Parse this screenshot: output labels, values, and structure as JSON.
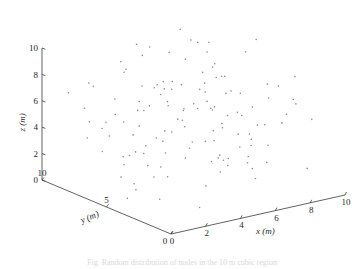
{
  "figure": {
    "background": "#ffffff",
    "caption": "Fig. Random distribution of nodes in the 10 m cubic region",
    "point_color": "#8a8a92",
    "axis_color": "#3a3a3a"
  },
  "chart_data": {
    "type": "scatter",
    "projection": "3d",
    "title": "",
    "xlabel": "x (m)",
    "ylabel": "y (m)",
    "zlabel": "z (m)",
    "xlim": [
      0,
      10
    ],
    "ylim": [
      0,
      10
    ],
    "zlim": [
      0,
      10
    ],
    "xticks": [
      0,
      2,
      4,
      6,
      8,
      10
    ],
    "yticks": [
      0,
      5,
      10
    ],
    "zticks": [
      0,
      2,
      4,
      6,
      8,
      10
    ],
    "xticklabels": [
      "0",
      "2",
      "4",
      "6",
      "8",
      "10"
    ],
    "yticklabels": [
      "0",
      "5",
      "10"
    ],
    "zticklabels": [
      "0",
      "2",
      "4",
      "6",
      "8",
      "10"
    ],
    "grid": false,
    "legend": null,
    "marker": ".",
    "marker_size": 1.6,
    "n_points": 132,
    "points": [
      [
        4.1,
        8.2,
        9.8
      ],
      [
        6.8,
        7.1,
        9.6
      ],
      [
        8.9,
        5.4,
        9.9
      ],
      [
        2.2,
        6.6,
        8.9
      ],
      [
        2.9,
        7.4,
        8.6
      ],
      [
        5.1,
        9.1,
        8.3
      ],
      [
        6.2,
        4.2,
        8.4
      ],
      [
        9.4,
        6.9,
        8.2
      ],
      [
        3.4,
        5.1,
        7.9
      ],
      [
        4.6,
        6.1,
        7.7
      ],
      [
        7.2,
        8.6,
        7.6
      ],
      [
        1.8,
        8.8,
        7.3
      ],
      [
        5.9,
        3.7,
        7.4
      ],
      [
        8.1,
        7.7,
        7.1
      ],
      [
        3.1,
        4.4,
        7.0
      ],
      [
        6.6,
        6.3,
        6.9
      ],
      [
        9.1,
        4.8,
        6.7
      ],
      [
        2.5,
        9.4,
        6.6
      ],
      [
        4.9,
        7.9,
        6.4
      ],
      [
        7.6,
        5.6,
        6.3
      ],
      [
        1.4,
        6.2,
        6.1
      ],
      [
        5.4,
        2.9,
        6.2
      ],
      [
        8.6,
        8.1,
        6.0
      ],
      [
        3.8,
        6.8,
        5.8
      ],
      [
        6.1,
        9.3,
        5.7
      ],
      [
        9.7,
        3.4,
        5.6
      ],
      [
        2.1,
        5.3,
        5.4
      ],
      [
        4.4,
        8.4,
        5.3
      ],
      [
        7.1,
        4.1,
        5.2
      ],
      [
        5.6,
        6.6,
        5.0
      ],
      [
        8.3,
        2.6,
        4.9
      ],
      [
        1.9,
        7.6,
        4.8
      ],
      [
        3.6,
        3.2,
        4.6
      ],
      [
        6.4,
        8.9,
        4.5
      ],
      [
        9.2,
        6.1,
        4.4
      ],
      [
        4.2,
        5.6,
        4.2
      ],
      [
        7.8,
        7.3,
        4.1
      ],
      [
        2.6,
        2.4,
        4.0
      ],
      [
        5.2,
        9.6,
        3.9
      ],
      [
        8.8,
        4.6,
        3.8
      ],
      [
        1.2,
        8.1,
        3.6
      ],
      [
        3.9,
        6.4,
        3.5
      ],
      [
        6.9,
        3.1,
        3.4
      ],
      [
        9.6,
        7.8,
        3.2
      ],
      [
        4.7,
        4.9,
        3.1
      ],
      [
        7.4,
        6.7,
        2.9
      ],
      [
        2.3,
        3.9,
        2.8
      ],
      [
        5.8,
        8.3,
        2.7
      ],
      [
        8.4,
        5.1,
        2.6
      ],
      [
        1.6,
        5.8,
        2.4
      ],
      [
        3.3,
        7.2,
        2.3
      ],
      [
        6.3,
        2.2,
        2.2
      ],
      [
        9.3,
        8.6,
        2.1
      ],
      [
        4.8,
        6.9,
        1.9
      ],
      [
        7.7,
        4.4,
        1.8
      ],
      [
        2.8,
        9.1,
        1.7
      ],
      [
        5.5,
        3.6,
        1.6
      ],
      [
        8.7,
        6.4,
        1.4
      ],
      [
        1.1,
        4.2,
        1.3
      ],
      [
        3.7,
        8.7,
        1.2
      ],
      [
        6.7,
        5.9,
        1.1
      ],
      [
        9.9,
        2.8,
        0.9
      ],
      [
        4.3,
        7.6,
        0.8
      ],
      [
        7.3,
        3.3,
        0.7
      ],
      [
        2.4,
        6.1,
        0.6
      ],
      [
        5.7,
        9.8,
        0.4
      ],
      [
        8.2,
        7.4,
        0.3
      ],
      [
        3.2,
        2.1,
        0.2
      ],
      [
        6.0,
        4.7,
        9.2
      ],
      [
        1.7,
        3.1,
        8.8
      ],
      [
        9.0,
        9.2,
        8.1
      ],
      [
        4.0,
        2.6,
        7.8
      ],
      [
        7.5,
        6.2,
        7.2
      ],
      [
        2.0,
        4.8,
        6.8
      ],
      [
        5.3,
        7.1,
        6.5
      ],
      [
        8.5,
        3.9,
        6.2
      ],
      [
        3.0,
        8.4,
        5.9
      ],
      [
        6.5,
        5.4,
        5.5
      ],
      [
        9.5,
        1.9,
        5.1
      ],
      [
        1.3,
        7.1,
        4.7
      ],
      [
        4.5,
        3.4,
        4.3
      ],
      [
        7.9,
        8.9,
        3.9
      ],
      [
        2.7,
        5.6,
        3.6
      ],
      [
        5.0,
        2.3,
        3.3
      ],
      [
        8.0,
        6.8,
        2.9
      ],
      [
        3.5,
        9.5,
        2.5
      ],
      [
        6.2,
        4.3,
        2.0
      ],
      [
        9.8,
        5.7,
        1.5
      ],
      [
        1.5,
        2.9,
        1.0
      ],
      [
        4.4,
        6.2,
        0.5
      ],
      [
        7.0,
        7.9,
        9.4
      ],
      [
        2.6,
        4.1,
        9.1
      ],
      [
        5.9,
        8.1,
        8.7
      ],
      [
        8.9,
        2.4,
        8.3
      ],
      [
        3.3,
        6.7,
        7.5
      ],
      [
        6.8,
        3.8,
        7.1
      ],
      [
        1.0,
        9.3,
        6.6
      ],
      [
        4.6,
        5.2,
        6.0
      ],
      [
        7.6,
        7.6,
        5.4
      ],
      [
        2.2,
        3.6,
        4.9
      ],
      [
        5.4,
        6.4,
        4.4
      ],
      [
        8.6,
        4.9,
        3.7
      ],
      [
        3.9,
        8.2,
        3.0
      ],
      [
        6.4,
        2.7,
        2.4
      ],
      [
        9.2,
        7.2,
        1.9
      ],
      [
        1.8,
        6.3,
        1.2
      ],
      [
        4.9,
        3.9,
        0.6
      ],
      [
        7.2,
        9.0,
        9.7
      ],
      [
        2.9,
        7.8,
        9.0
      ],
      [
        5.6,
        5.1,
        8.5
      ],
      [
        8.3,
        8.4,
        7.9
      ],
      [
        3.6,
        2.8,
        7.3
      ],
      [
        6.1,
        6.0,
        6.7
      ],
      [
        9.4,
        3.2,
        6.1
      ],
      [
        1.4,
        8.6,
        5.6
      ],
      [
        4.2,
        4.6,
        5.0
      ],
      [
        7.4,
        6.9,
        4.5
      ],
      [
        2.5,
        9.7,
        3.8
      ],
      [
        5.1,
        3.1,
        3.2
      ],
      [
        8.8,
        5.8,
        2.6
      ],
      [
        3.1,
        7.4,
        2.0
      ],
      [
        6.6,
        4.5,
        1.4
      ],
      [
        9.0,
        8.8,
        0.8
      ],
      [
        1.2,
        5.0,
        0.3
      ],
      [
        4.7,
        8.0,
        9.5
      ],
      [
        7.8,
        2.2,
        8.0
      ],
      [
        2.1,
        6.5,
        5.2
      ],
      [
        5.8,
        7.3,
        4.0
      ],
      [
        8.1,
        3.5,
        1.6
      ],
      [
        3.4,
        5.9,
        0.9
      ],
      [
        6.9,
        8.5,
        5.8
      ],
      [
        9.6,
        4.0,
        4.6
      ]
    ]
  }
}
